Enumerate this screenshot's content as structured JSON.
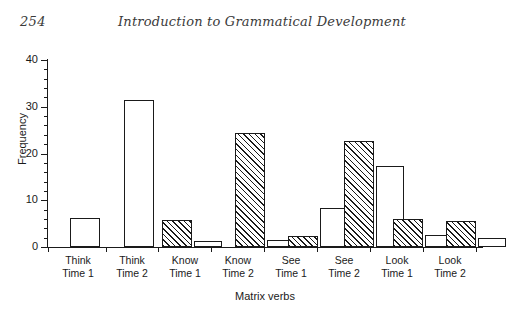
{
  "page": {
    "folio": "254",
    "running_title": "Introduction to Grammatical Development"
  },
  "chart_data": {
    "type": "bar",
    "title": "",
    "xlabel": "Matrix verbs",
    "ylabel": "Frequency",
    "ylim": [
      0,
      40
    ],
    "ytick_labels": [
      "0",
      "10",
      "20",
      "30",
      "40"
    ],
    "ytick_values": [
      0,
      10,
      20,
      30,
      40
    ],
    "yminor_step": 2,
    "grid": false,
    "legend": "none",
    "categories": [
      "Think Time 1",
      "Think Time 2",
      "Know Time 1",
      "Know Time 2",
      "See Time 1",
      "See Time 2",
      "Look Time 1",
      "Look Time 2"
    ],
    "category_lines": [
      [
        "Think",
        "Time 1"
      ],
      [
        "Think",
        "Time 2"
      ],
      [
        "Know",
        "Time 1"
      ],
      [
        "Know",
        "Time 2"
      ],
      [
        "See",
        "Time 1"
      ],
      [
        "See",
        "Time 2"
      ],
      [
        "Look",
        "Time 1"
      ],
      [
        "Look",
        "Time 2"
      ]
    ],
    "series": [
      {
        "name": "hatched",
        "fill": "diagonal-hatch",
        "values": [
          0,
          0,
          5.8,
          24.3,
          2.3,
          22.7,
          6.0,
          5.5
        ]
      },
      {
        "name": "white",
        "fill": "white",
        "values": [
          6.3,
          31.5,
          1.2,
          1.5,
          8.3,
          17.3,
          2.5,
          2.0
        ]
      }
    ],
    "bars": [
      {
        "group": "Think Time 1",
        "series": "white",
        "value": 6.3,
        "x": 22,
        "w": 30
      },
      {
        "group": "Think Time 2",
        "series": "white",
        "value": 31.5,
        "x": 76,
        "w": 30
      },
      {
        "group": "Know Time 1",
        "series": "hatched",
        "value": 5.8,
        "x": 114,
        "w": 30
      },
      {
        "group": "Know Time 1",
        "series": "white",
        "value": 1.2,
        "x": 146,
        "w": 28
      },
      {
        "group": "Know Time 2",
        "series": "hatched",
        "value": 24.3,
        "x": 187,
        "w": 30
      },
      {
        "group": "Know Time 2",
        "series": "white",
        "value": 1.5,
        "x": 219,
        "w": 28
      },
      {
        "group": "See Time 1",
        "series": "hatched",
        "value": 2.3,
        "x": 240,
        "w": 30
      },
      {
        "group": "See Time 1",
        "series": "white",
        "value": 8.3,
        "x": 272,
        "w": 28
      },
      {
        "group": "See Time 2",
        "series": "hatched",
        "value": 22.7,
        "x": 296,
        "w": 30
      },
      {
        "group": "See Time 2",
        "series": "white",
        "value": 17.3,
        "x": 328,
        "w": 28
      },
      {
        "group": "Look Time 1",
        "series": "hatched",
        "value": 6.0,
        "x": 345,
        "w": 30
      },
      {
        "group": "Look Time 1",
        "series": "white",
        "value": 2.5,
        "x": 377,
        "w": 28
      },
      {
        "group": "Look Time 2",
        "series": "hatched",
        "value": 5.5,
        "x": 398,
        "w": 30
      },
      {
        "group": "Look Time 2",
        "series": "white",
        "value": 2.0,
        "x": 430,
        "w": 28
      }
    ],
    "group_tick_positions": [
      0,
      58,
      110,
      163,
      216,
      269,
      322,
      375,
      428
    ],
    "group_label_centers": [
      30,
      84,
      137,
      190,
      243,
      296,
      349,
      402
    ],
    "colors": {
      "ink": "#1a1a1a",
      "background": "#ffffff"
    }
  }
}
